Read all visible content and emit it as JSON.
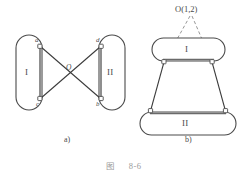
{
  "figure": {
    "caption_prefix": "图",
    "caption_number": "8-6",
    "colors": {
      "stroke": "#4a4a4a",
      "link_fill": "#ffffff",
      "caption": "#9a9a9a",
      "background": "#ffffff"
    }
  },
  "diagram_a": {
    "sublabel": "a)",
    "link_left_label": "I",
    "link_right_label": "II",
    "joint_a_label": "a",
    "joint_c_label": "c",
    "joint_d_label": "d",
    "joint_b_label": "b",
    "center_label": "O"
  },
  "diagram_b": {
    "sublabel": "b)",
    "link_top_label": "I",
    "link_bottom_label": "II",
    "center_label": "O(1,2)"
  }
}
